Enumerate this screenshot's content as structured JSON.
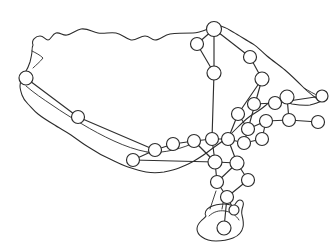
{
  "figure": {
    "kind": "network-map",
    "background_color": "#ffffff",
    "outline_color": "#2b2b2b",
    "edge_color": "#2f2f2f",
    "node_fill_color": "#ffffff",
    "node_stroke_color": "#2b2b2b",
    "width": 330,
    "height": 252,
    "has_text_labels": false,
    "node_count": 31,
    "edge_count": 40
  },
  "chart_data": {
    "type": "scatter",
    "title": "",
    "xlabel": "",
    "ylabel": "",
    "xlim": [
      0,
      330
    ],
    "ylim": [
      0,
      252
    ],
    "grid": false,
    "legend": "none",
    "nodes": [
      {
        "id": "n1",
        "x": 26,
        "y": 78,
        "r": 7.0
      },
      {
        "id": "n2",
        "x": 78,
        "y": 117,
        "r": 6.5
      },
      {
        "id": "n3",
        "x": 197,
        "y": 44,
        "r": 6.5
      },
      {
        "id": "n4",
        "x": 214,
        "y": 29,
        "r": 7.5
      },
      {
        "id": "n5",
        "x": 250,
        "y": 57,
        "r": 6.5
      },
      {
        "id": "n6",
        "x": 262,
        "y": 79,
        "r": 7.0
      },
      {
        "id": "n7",
        "x": 214,
        "y": 73,
        "r": 7.0
      },
      {
        "id": "n8",
        "x": 254,
        "y": 104,
        "r": 6.5
      },
      {
        "id": "n9",
        "x": 275,
        "y": 103,
        "r": 6.5
      },
      {
        "id": "n10",
        "x": 287,
        "y": 97,
        "r": 7.0
      },
      {
        "id": "n11",
        "x": 289,
        "y": 120,
        "r": 6.5
      },
      {
        "id": "n12",
        "x": 318,
        "y": 122,
        "r": 6.5
      },
      {
        "id": "n13",
        "x": 322,
        "y": 96,
        "r": 6.0
      },
      {
        "id": "n14",
        "x": 266,
        "y": 121,
        "r": 6.5
      },
      {
        "id": "n15",
        "x": 248,
        "y": 129,
        "r": 6.5
      },
      {
        "id": "n16",
        "x": 238,
        "y": 114,
        "r": 6.5
      },
      {
        "id": "n17",
        "x": 262,
        "y": 139,
        "r": 6.5
      },
      {
        "id": "n18",
        "x": 244,
        "y": 143,
        "r": 6.5
      },
      {
        "id": "n19",
        "x": 228,
        "y": 139,
        "r": 6.5
      },
      {
        "id": "n20",
        "x": 212,
        "y": 139,
        "r": 6.5
      },
      {
        "id": "n21",
        "x": 194,
        "y": 141,
        "r": 6.5
      },
      {
        "id": "n22",
        "x": 173,
        "y": 144,
        "r": 6.5
      },
      {
        "id": "n23",
        "x": 155,
        "y": 150,
        "r": 6.5
      },
      {
        "id": "n24",
        "x": 133,
        "y": 160,
        "r": 6.5
      },
      {
        "id": "n25",
        "x": 215,
        "y": 162,
        "r": 7.0
      },
      {
        "id": "n26",
        "x": 237,
        "y": 163,
        "r": 7.0
      },
      {
        "id": "n27",
        "x": 248,
        "y": 180,
        "r": 6.5
      },
      {
        "id": "n28",
        "x": 217,
        "y": 182,
        "r": 6.5
      },
      {
        "id": "n29",
        "x": 227,
        "y": 197,
        "r": 6.5
      },
      {
        "id": "n30",
        "x": 224,
        "y": 228,
        "r": 7.0
      },
      {
        "id": "n31",
        "x": 234,
        "y": 210,
        "r": 5.0
      }
    ],
    "edges": [
      [
        "n1",
        "n2"
      ],
      [
        "n2",
        "n23"
      ],
      [
        "n3",
        "n4"
      ],
      [
        "n4",
        "n5"
      ],
      [
        "n3",
        "n7"
      ],
      [
        "n4",
        "n7"
      ],
      [
        "n5",
        "n6"
      ],
      [
        "n6",
        "n15"
      ],
      [
        "n6",
        "n16"
      ],
      [
        "n7",
        "n20"
      ],
      [
        "n8",
        "n9"
      ],
      [
        "n9",
        "n10"
      ],
      [
        "n9",
        "n13"
      ],
      [
        "n10",
        "n11"
      ],
      [
        "n11",
        "n12"
      ],
      [
        "n11",
        "n14"
      ],
      [
        "n14",
        "n15"
      ],
      [
        "n14",
        "n17"
      ],
      [
        "n15",
        "n16"
      ],
      [
        "n15",
        "n18"
      ],
      [
        "n16",
        "n19"
      ],
      [
        "n17",
        "n18"
      ],
      [
        "n18",
        "n19"
      ],
      [
        "n19",
        "n20"
      ],
      [
        "n20",
        "n21"
      ],
      [
        "n21",
        "n22"
      ],
      [
        "n22",
        "n23"
      ],
      [
        "n23",
        "n24"
      ],
      [
        "n24",
        "n25"
      ],
      [
        "n21",
        "n25"
      ],
      [
        "n20",
        "n25"
      ],
      [
        "n19",
        "n26"
      ],
      [
        "n25",
        "n26"
      ],
      [
        "n26",
        "n27"
      ],
      [
        "n25",
        "n28"
      ],
      [
        "n26",
        "n28"
      ],
      [
        "n28",
        "n29"
      ],
      [
        "n27",
        "n29"
      ],
      [
        "n29",
        "n30"
      ],
      [
        "n29",
        "n31"
      ]
    ]
  }
}
